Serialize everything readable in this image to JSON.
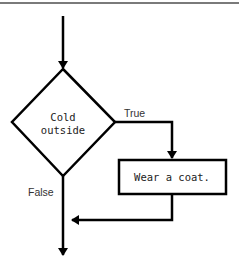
{
  "diagram": {
    "type": "flowchart",
    "decision": {
      "line1": "Cold",
      "line2": "outside"
    },
    "process": {
      "label": "Wear a coat."
    },
    "edges": {
      "true_label": "True",
      "false_label": "False"
    },
    "colors": {
      "stroke": "#000000",
      "rule": "#7a7a7a",
      "background": "#ffffff"
    }
  }
}
